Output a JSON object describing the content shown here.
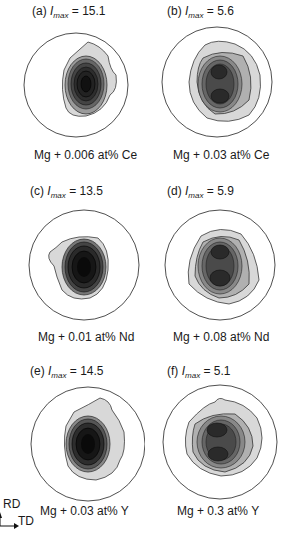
{
  "figure": {
    "panels": [
      {
        "label": "(a)",
        "imax_symbol": "I",
        "imax_sub": "max",
        "imax_value": "15.1",
        "caption": "Mg + 0.006 at% Ce",
        "type": "single-peak"
      },
      {
        "label": "(b)",
        "imax_symbol": "I",
        "imax_sub": "max",
        "imax_value": "5.6",
        "caption": "Mg + 0.03 at% Ce",
        "type": "double-peak"
      },
      {
        "label": "(c)",
        "imax_symbol": "I",
        "imax_sub": "max",
        "imax_value": "13.5",
        "caption": "Mg + 0.01 at% Nd",
        "type": "single-peak"
      },
      {
        "label": "(d)",
        "imax_symbol": "I",
        "imax_sub": "max",
        "imax_value": "5.9",
        "caption": "Mg + 0.08 at% Nd",
        "type": "double-peak"
      },
      {
        "label": "(e)",
        "imax_symbol": "I",
        "imax_sub": "max",
        "imax_value": "14.5",
        "caption": "Mg + 0.03 at% Y",
        "type": "single-peak"
      },
      {
        "label": "(f)",
        "imax_symbol": "I",
        "imax_sub": "max",
        "imax_value": "5.1",
        "caption": "Mg + 0.3 at% Y",
        "type": "double-peak"
      }
    ],
    "axes": {
      "rd_label": "RD",
      "td_label": "TD"
    },
    "colors": {
      "outline": "#222222",
      "fill_light": "#d8d8d8",
      "fill_mid": "#9a9a9a",
      "fill_dark": "#3a3a3a",
      "fill_core": "#111111"
    }
  }
}
